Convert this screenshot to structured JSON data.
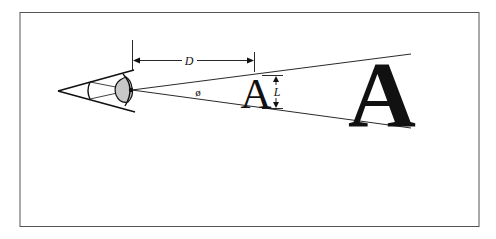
{
  "diagram": {
    "labels": {
      "distance": "D",
      "angle": "ø",
      "size": "L",
      "small_letter": "A",
      "large_letter": "A"
    },
    "colors": {
      "stroke": "#111111",
      "eye_fill": "#c8c8c8",
      "frame": "#555555",
      "background": "#ffffff"
    }
  }
}
